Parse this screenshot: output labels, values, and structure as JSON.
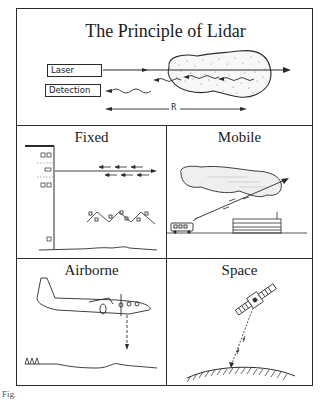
{
  "figure": {
    "main_panel": {
      "title": "The Principle of Lidar",
      "labels": {
        "laser": "Laser",
        "detection": "Detection",
        "range": "R"
      }
    },
    "panels": [
      {
        "id": "fixed",
        "title": "Fixed"
      },
      {
        "id": "mobile",
        "title": "Mobile"
      },
      {
        "id": "airborne",
        "title": "Airborne"
      },
      {
        "id": "space",
        "title": "Space"
      }
    ],
    "caption_fragment": "Fig."
  },
  "colors": {
    "line": "#2a2a2a",
    "background": "#ffffff",
    "cloud_fill": "#f4f4f4"
  }
}
